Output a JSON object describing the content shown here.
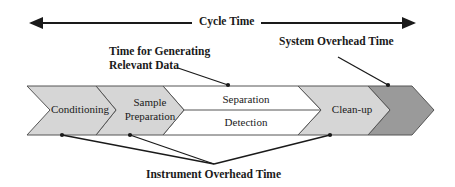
{
  "title": "Cycle Time",
  "annotations": {
    "relevant_data": [
      "Time for Generating",
      "Relevant Data"
    ],
    "system_overhead": "System Overhead Time",
    "instrument_overhead": "Instrument Overhead Time"
  },
  "stages": [
    {
      "label": "Conditioning",
      "fill": "#d4d4d4"
    },
    {
      "label_lines": [
        "Sample",
        "Preparation"
      ],
      "fill": "#d4d4d4"
    },
    {
      "label_top": "Separation",
      "label_bottom": "Detection",
      "fill": "#ffffff"
    },
    {
      "label": "Clean-up",
      "fill": "#d4d4d4"
    },
    {
      "label": "",
      "fill": "#9a9a9a"
    }
  ],
  "colors": {
    "stroke": "#333333",
    "arrow": "#1a1a1a"
  }
}
